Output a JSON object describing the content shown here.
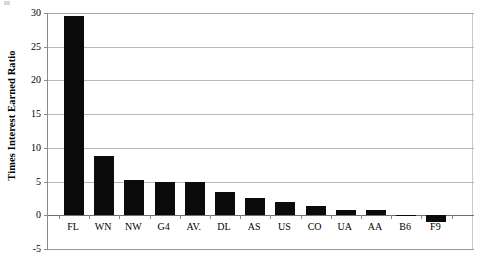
{
  "chart_data": {
    "type": "bar",
    "title": "",
    "xlabel": "",
    "ylabel": "Times Interest Earned Ratio",
    "categories": [
      "FL",
      "WN",
      "NW",
      "G4",
      "AV.",
      "DL",
      "AS",
      "US",
      "CO",
      "UA",
      "AA",
      "B6",
      "F9"
    ],
    "values": [
      29.5,
      8.8,
      5.2,
      5.0,
      5.0,
      3.5,
      2.5,
      2.0,
      1.4,
      0.8,
      0.8,
      0.1,
      -1.0
    ],
    "ylim": [
      -5,
      30
    ],
    "yticks": [
      30,
      25,
      20,
      15,
      10,
      5,
      0,
      -5
    ],
    "ytick_labels": [
      "30",
      "25",
      "20",
      "15",
      "10",
      "5",
      "0",
      "-5"
    ],
    "grid": true,
    "legend": "none",
    "bar_color": "#0b0b0b",
    "grid_color": "#b9b9b9",
    "axis_color": "#8a8a8a",
    "background": "#ffffff"
  }
}
